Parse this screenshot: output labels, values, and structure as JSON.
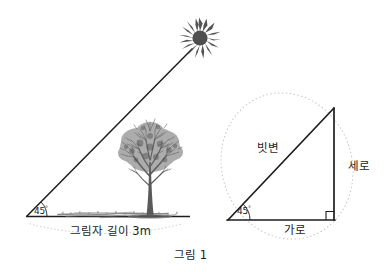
{
  "figure": {
    "caption": "그림 1",
    "background_color": "#ffffff",
    "ink_color": "#1d1d1d",
    "sun_color": "#555555",
    "tree_color": "#5a5a5a",
    "guide_color": "#b8b8b8"
  },
  "left_diagram": {
    "name": "tree-shadow-45-degree-diagram",
    "angle_label": "45",
    "angle_degree_symbol": "°",
    "ground_label": "그림자 길이 3m",
    "sun_icon": "sun-icon",
    "tree_icon": "tree-icon"
  },
  "right_diagram": {
    "name": "right-triangle-45-degree-diagram",
    "angle_label": "45",
    "angle_degree_symbol": "°",
    "hypotenuse_label": "빗변",
    "vertical_label": "세로",
    "horizontal_label": "가로",
    "right_angle_marker": "right-angle-icon"
  }
}
